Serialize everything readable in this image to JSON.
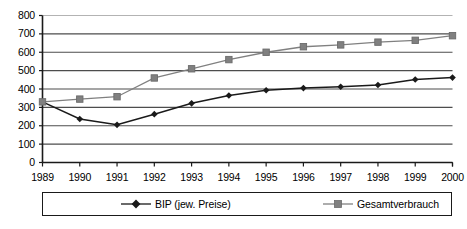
{
  "chart_data": {
    "type": "line",
    "title": "",
    "subtitle": "",
    "xlabel": "",
    "ylabel": "",
    "categories": [
      "1989",
      "1990",
      "1991",
      "1992",
      "1993",
      "1994",
      "1995",
      "1996",
      "1997",
      "1998",
      "1999",
      "2000"
    ],
    "series": [
      {
        "name": "BIP (jew. Preise)",
        "marker": "diamond",
        "color": "#1a1a1a",
        "values": [
          330,
          237,
          205,
          263,
          322,
          365,
          393,
          405,
          412,
          422,
          452,
          462
        ]
      },
      {
        "name": "Gesamtverbrauch",
        "marker": "square",
        "color": "#808080",
        "values": [
          330,
          345,
          358,
          460,
          510,
          560,
          600,
          630,
          640,
          655,
          665,
          690
        ]
      }
    ],
    "ylim": [
      0,
      800
    ],
    "ytick_step": 100,
    "yticks": [
      "800",
      "700",
      "600",
      "500",
      "400",
      "300",
      "200",
      "100",
      "0"
    ],
    "grid": "horizontal",
    "legend_position": "bottom",
    "axis_color": "#1a1a1a",
    "grid_color": "#4d4d4d",
    "background": "#ffffff"
  }
}
